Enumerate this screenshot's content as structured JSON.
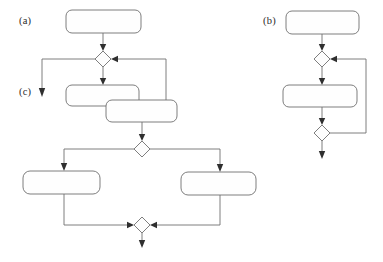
{
  "figure": {
    "kind": "uml-activity-diagram",
    "width": 383,
    "height": 262,
    "background_color": "#ffffff",
    "stroke_color": "#6f6f6f",
    "arrowhead_color": "#2f2f2f",
    "node_fill_color": "#fefefe",
    "label_color": "#2b2b2b"
  },
  "labels": {
    "a": "(a)",
    "b": "(b)",
    "c": "(c)"
  },
  "panels": [
    {
      "id": "panel-a",
      "label": "(a)",
      "label_x": 19,
      "label_y": 23,
      "nodes": [
        {
          "id": "a-action-1",
          "type": "action",
          "x": 66,
          "y": 10,
          "w": 75,
          "h": 23,
          "r": 6
        },
        {
          "id": "a-merge-1",
          "type": "decision",
          "cx": 103,
          "cy": 59,
          "rx": 8,
          "ry": 8
        },
        {
          "id": "a-action-2",
          "type": "action",
          "x": 66,
          "y": 85,
          "w": 73,
          "h": 21,
          "r": 6
        },
        {
          "id": "a-action-3",
          "type": "action",
          "x": 106,
          "y": 100,
          "w": 71,
          "h": 22,
          "r": 6
        },
        {
          "id": "a-fork-1",
          "type": "decision",
          "cx": 142,
          "cy": 149,
          "rx": 8,
          "ry": 8
        },
        {
          "id": "a-action-4",
          "type": "action",
          "x": 23,
          "y": 171,
          "w": 77,
          "h": 23,
          "r": 7
        },
        {
          "id": "a-action-5",
          "type": "action",
          "x": 181,
          "y": 172,
          "w": 75,
          "h": 23,
          "r": 7
        },
        {
          "id": "a-merge-2",
          "type": "decision",
          "cx": 142,
          "cy": 225,
          "rx": 8,
          "ry": 8
        }
      ],
      "edges": [
        {
          "id": "a-edge-1",
          "from": "a-action-1",
          "to": "a-merge-1",
          "points": "103,33 103,47",
          "arrow": "down",
          "tip_x": 103,
          "tip_y": 51
        },
        {
          "id": "a-edge-2",
          "from": "a-merge-1",
          "to": "c-exit",
          "points": "95,59 42,59 42,91",
          "arrow": "down",
          "tip_x": 42,
          "tip_y": 96
        },
        {
          "id": "a-edge-3",
          "from": "a-merge-1",
          "to": "a-action-2",
          "points": "103,67 103,80",
          "arrow": "down",
          "tip_x": 103,
          "tip_y": 85
        },
        {
          "id": "a-edge-4",
          "from": "a-action-3",
          "to": "a-merge-1",
          "points": "166,111 166,59 116,59",
          "arrow": "left",
          "tip_x": 111,
          "tip_y": 59
        },
        {
          "id": "a-edge-5",
          "from": "a-action-3",
          "to": "a-fork-1",
          "points": "142,122 142,137",
          "arrow": "down",
          "tip_x": 142,
          "tip_y": 141
        },
        {
          "id": "a-edge-6",
          "from": "a-fork-1",
          "to": "a-action-4",
          "points": "134,149 64,149 64,166",
          "arrow": "down",
          "tip_x": 64,
          "tip_y": 171
        },
        {
          "id": "a-edge-7",
          "from": "a-fork-1",
          "to": "a-action-5",
          "points": "150,149 220,149 220,167",
          "arrow": "down",
          "tip_x": 220,
          "tip_y": 172
        },
        {
          "id": "a-edge-8",
          "from": "a-action-4",
          "to": "a-merge-2",
          "points": "64,194 64,225 129,225",
          "arrow": "right",
          "tip_x": 134,
          "tip_y": 225
        },
        {
          "id": "a-edge-9",
          "from": "a-action-5",
          "to": "a-merge-2",
          "points": "220,195 220,225 155,225",
          "arrow": "left",
          "tip_x": 150,
          "tip_y": 225
        },
        {
          "id": "a-edge-10",
          "from": "a-merge-2",
          "to": "a-exit",
          "points": "142,233 142,243",
          "arrow": "down",
          "tip_x": 142,
          "tip_y": 248
        }
      ]
    },
    {
      "id": "panel-b",
      "label": "(b)",
      "label_x": 263,
      "label_y": 23,
      "nodes": [
        {
          "id": "b-action-1",
          "type": "action",
          "x": 286,
          "y": 11,
          "w": 73,
          "h": 23,
          "r": 6
        },
        {
          "id": "b-merge-1",
          "type": "decision",
          "cx": 322,
          "cy": 59,
          "rx": 8,
          "ry": 8
        },
        {
          "id": "b-action-2",
          "type": "action",
          "x": 283,
          "y": 85,
          "w": 74,
          "h": 22,
          "r": 6
        },
        {
          "id": "b-merge-2",
          "type": "decision",
          "cx": 322,
          "cy": 133,
          "rx": 8,
          "ry": 8
        }
      ],
      "edges": [
        {
          "id": "b-edge-1",
          "from": "b-action-1",
          "to": "b-merge-1",
          "points": "322,34 322,47",
          "arrow": "down",
          "tip_x": 322,
          "tip_y": 51
        },
        {
          "id": "b-edge-2",
          "from": "b-merge-1",
          "to": "b-action-2",
          "points": "322,67 322,80",
          "arrow": "down",
          "tip_x": 322,
          "tip_y": 85
        },
        {
          "id": "b-edge-3",
          "from": "b-action-2",
          "to": "b-merge-2",
          "points": "322,107 322,121",
          "arrow": "down",
          "tip_x": 322,
          "tip_y": 125
        },
        {
          "id": "b-edge-4",
          "from": "b-merge-2",
          "to": "b-merge-1",
          "points": "330,133 366,133 366,59 335,59",
          "arrow": "left",
          "tip_x": 330,
          "tip_y": 59
        },
        {
          "id": "b-edge-5",
          "from": "b-merge-2",
          "to": "b-exit",
          "points": "322,141 322,154",
          "arrow": "down",
          "tip_x": 322,
          "tip_y": 159
        }
      ]
    }
  ]
}
